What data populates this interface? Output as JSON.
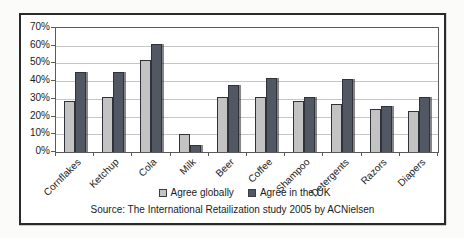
{
  "chart_data": {
    "type": "bar",
    "title": "",
    "xlabel": "",
    "ylabel": "",
    "ylim": [
      0,
      70
    ],
    "ytick_step": 10,
    "ytick_labels": [
      "0%",
      "10%",
      "20%",
      "30%",
      "40%",
      "50%",
      "60%",
      "70%"
    ],
    "grid": true,
    "legend_position": "bottom",
    "categories": [
      "Cornflakes",
      "Ketchup",
      "Cola",
      "Milk",
      "Beer",
      "Coffee",
      "Shampoo",
      "Detergents",
      "Razors",
      "Diapers"
    ],
    "series": [
      {
        "name": "Agree globally",
        "color": "#c3c3c3",
        "values": [
          29,
          31,
          52,
          10,
          31,
          31,
          29,
          27,
          24,
          23
        ]
      },
      {
        "name": "Agree in the UK",
        "color": "#525863",
        "values": [
          45,
          45,
          61,
          4,
          38,
          42,
          31,
          41,
          26,
          31
        ]
      }
    ]
  },
  "source_note": "Source: The International Retailization study 2005 by ACNielsen",
  "colors": {
    "frame_border": "#2a2a2a",
    "plot_border": "#5a5a5a",
    "gridline": "#c6c6c6",
    "background": "#ffffff",
    "text": "#1b1b1b"
  }
}
